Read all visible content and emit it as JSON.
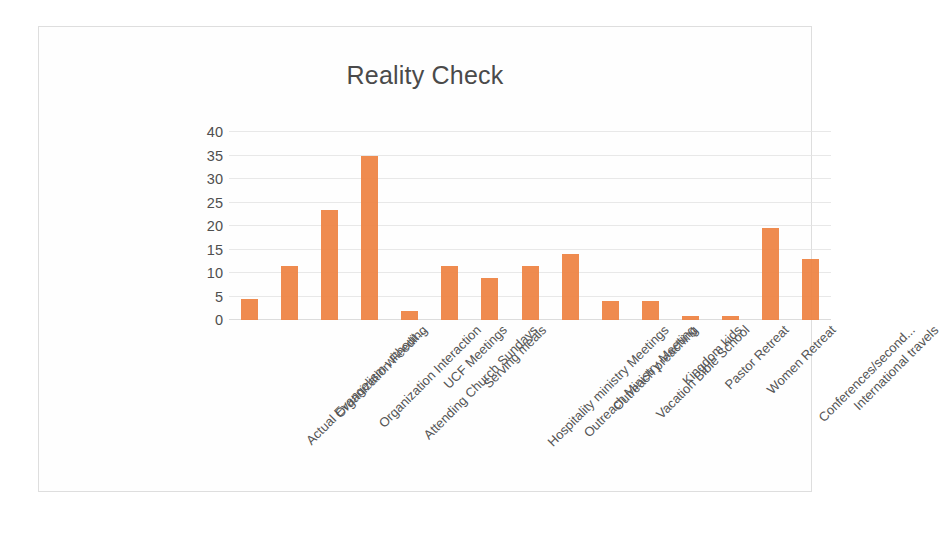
{
  "chart_data": {
    "type": "bar",
    "title": "Reality Check",
    "xlabel": "",
    "ylabel": "",
    "ylim": [
      0,
      40
    ],
    "yticks": [
      0,
      5,
      10,
      15,
      20,
      25,
      30,
      35,
      40
    ],
    "grid": true,
    "legend": "none",
    "bar_color": "#ee8242",
    "categories": [
      "Actual Evangelism without...",
      "Organization Feeding",
      "Organization Interaction",
      "Attending Church Sundays",
      "UCF Meetings",
      "Serving meals",
      "Hospitality ministry Meetings",
      "Outreach Ministry Meeting",
      "Outreach preaching",
      "Vacation Bible School",
      "Kingdom kids",
      "Pastor Retreat",
      "Women Retreat",
      "Conferences/second...",
      "International travels"
    ],
    "values": [
      4.5,
      11.5,
      23.5,
      35,
      2,
      11.5,
      9,
      11.5,
      14,
      4,
      4,
      0.8,
      0.8,
      19.5,
      13
    ]
  }
}
